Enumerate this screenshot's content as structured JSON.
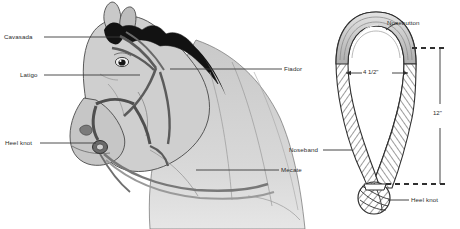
{
  "figure": {
    "background_color": "#ffffff",
    "line_color": "#3a3a3a",
    "text_color": "#2b2b2b",
    "shade_light": "#d8d8d8",
    "shade_mid": "#bdbdbd",
    "shade_dark": "#8c8c8c",
    "mane_color": "#111111"
  },
  "left_panel": {
    "name": "horse-head-diagram",
    "labels": [
      {
        "id": "cavasada",
        "text": "Cavasada",
        "side": "left",
        "x": 4,
        "y": 33
      },
      {
        "id": "latigo",
        "text": "Latigo",
        "side": "left",
        "x": 20,
        "y": 71
      },
      {
        "id": "heel-knot",
        "text": "Heel knot",
        "side": "left",
        "x": 5,
        "y": 139
      },
      {
        "id": "fiador",
        "text": "Fiador",
        "side": "right",
        "x": 284,
        "y": 65
      },
      {
        "id": "mecate",
        "text": "Mecate",
        "side": "right",
        "x": 281,
        "y": 166
      }
    ]
  },
  "right_panel": {
    "name": "bosal-dimension-diagram",
    "labels": [
      {
        "id": "nosebutton",
        "text": "Nosebutton",
        "side": "right",
        "x": 387,
        "y": 19
      },
      {
        "id": "noseband",
        "text": "Noseband",
        "side": "left",
        "x": 289,
        "y": 146
      },
      {
        "id": "heel-knot-2",
        "text": "Heel knot",
        "side": "right",
        "x": 411,
        "y": 196
      }
    ],
    "dimensions": [
      {
        "id": "width-dimension",
        "text": "4 1/2\"",
        "orientation": "horizontal"
      },
      {
        "id": "height-dimension",
        "text": "12\"",
        "orientation": "vertical"
      }
    ]
  }
}
